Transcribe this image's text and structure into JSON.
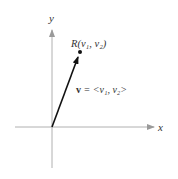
{
  "diagram": {
    "type": "vector-in-plane",
    "axes": {
      "x_label": "x",
      "y_label": "y",
      "color": "#b0b0b0"
    },
    "origin": {
      "px": [
        52,
        127
      ]
    },
    "vector": {
      "name": "v",
      "label": "v = <v₁, v₂>",
      "label_bold_part": "v",
      "label_rest": " = <v₁, v₂>",
      "color": "#111111"
    },
    "point": {
      "name": "R",
      "label": "R(v₁, v₂)"
    }
  }
}
